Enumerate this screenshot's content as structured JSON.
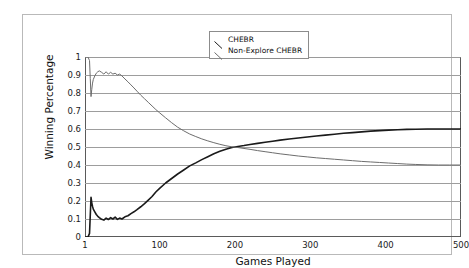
{
  "figure": {
    "background_color": "#ffffff",
    "frame_color": "#b9b9b9"
  },
  "legend": {
    "position": "top-center",
    "entries": [
      {
        "label": "CHEBR",
        "color": "#1a1a1a",
        "swatch": "diagonal-line-icon"
      },
      {
        "label": "Non-Explore CHEBR",
        "color": "#6d6d6d",
        "swatch": "diagonal-line-icon"
      }
    ]
  },
  "chart_data": {
    "type": "line",
    "title": "",
    "xlabel": "Games Played",
    "ylabel": "Winning Percentage",
    "xlim": [
      1,
      500
    ],
    "ylim": [
      0,
      1
    ],
    "grid": "horizontal",
    "legend_position": "top-center",
    "xticks": [
      1,
      100,
      200,
      300,
      400,
      500
    ],
    "xtick_labels": [
      "1",
      "100",
      "200",
      "300",
      "400",
      "500"
    ],
    "yticks": [
      0,
      0.1,
      0.2,
      0.3,
      0.4,
      0.5,
      0.6,
      0.7,
      0.8,
      0.9,
      1
    ],
    "ytick_labels": [
      "0",
      "0.1",
      "0.2",
      "0.3",
      "0.4",
      "0.5",
      "0.6",
      "0.7",
      "0.8",
      "0.9",
      "1"
    ],
    "series": [
      {
        "name": "CHEBR",
        "color": "#1a1a1a",
        "width": 1.6,
        "x": [
          1,
          3,
          5,
          7,
          8,
          9,
          10,
          11,
          12,
          14,
          16,
          18,
          20,
          23,
          26,
          29,
          32,
          35,
          38,
          41,
          44,
          47,
          50,
          54,
          58,
          62,
          66,
          70,
          75,
          80,
          85,
          90,
          95,
          100,
          108,
          116,
          124,
          132,
          140,
          148,
          156,
          164,
          172,
          180,
          188,
          196,
          204,
          212,
          220,
          230,
          240,
          250,
          260,
          272,
          284,
          296,
          308,
          320,
          332,
          344,
          356,
          368,
          380,
          392,
          404,
          416,
          428,
          440,
          455,
          470,
          485,
          500
        ],
        "y": [
          0.0,
          0.0,
          0.0,
          0.02,
          0.12,
          0.22,
          0.19,
          0.17,
          0.155,
          0.14,
          0.125,
          0.115,
          0.108,
          0.098,
          0.094,
          0.105,
          0.097,
          0.108,
          0.1,
          0.11,
          0.098,
          0.105,
          0.1,
          0.112,
          0.118,
          0.13,
          0.14,
          0.152,
          0.168,
          0.185,
          0.205,
          0.225,
          0.25,
          0.27,
          0.3,
          0.325,
          0.35,
          0.372,
          0.395,
          0.412,
          0.43,
          0.446,
          0.462,
          0.476,
          0.488,
          0.497,
          0.503,
          0.508,
          0.514,
          0.52,
          0.526,
          0.532,
          0.538,
          0.544,
          0.55,
          0.556,
          0.561,
          0.566,
          0.571,
          0.576,
          0.58,
          0.584,
          0.588,
          0.591,
          0.594,
          0.596,
          0.598,
          0.599,
          0.6,
          0.6,
          0.6,
          0.6
        ]
      },
      {
        "name": "Non-Explore CHEBR",
        "color": "#6d6d6d",
        "width": 1.0,
        "x": [
          1,
          3,
          5,
          7,
          8,
          9,
          10,
          11,
          12,
          14,
          16,
          18,
          20,
          23,
          26,
          29,
          32,
          35,
          38,
          41,
          44,
          47,
          50,
          54,
          58,
          62,
          66,
          70,
          75,
          80,
          85,
          90,
          95,
          100,
          108,
          116,
          124,
          132,
          140,
          148,
          156,
          164,
          172,
          180,
          188,
          196,
          204,
          212,
          220,
          230,
          240,
          250,
          260,
          272,
          284,
          296,
          308,
          320,
          332,
          344,
          356,
          368,
          380,
          392,
          404,
          416,
          428,
          440,
          455,
          470,
          485,
          500
        ],
        "y": [
          1.0,
          1.0,
          1.0,
          0.98,
          0.88,
          0.78,
          0.82,
          0.855,
          0.875,
          0.895,
          0.91,
          0.918,
          0.923,
          0.915,
          0.905,
          0.918,
          0.905,
          0.915,
          0.905,
          0.91,
          0.9,
          0.905,
          0.895,
          0.878,
          0.862,
          0.845,
          0.828,
          0.81,
          0.788,
          0.768,
          0.748,
          0.728,
          0.708,
          0.69,
          0.662,
          0.635,
          0.61,
          0.59,
          0.572,
          0.558,
          0.545,
          0.534,
          0.524,
          0.515,
          0.507,
          0.501,
          0.497,
          0.492,
          0.487,
          0.48,
          0.474,
          0.468,
          0.462,
          0.456,
          0.45,
          0.445,
          0.44,
          0.436,
          0.432,
          0.428,
          0.424,
          0.42,
          0.417,
          0.414,
          0.411,
          0.408,
          0.405,
          0.403,
          0.401,
          0.4,
          0.4,
          0.4
        ]
      }
    ]
  }
}
